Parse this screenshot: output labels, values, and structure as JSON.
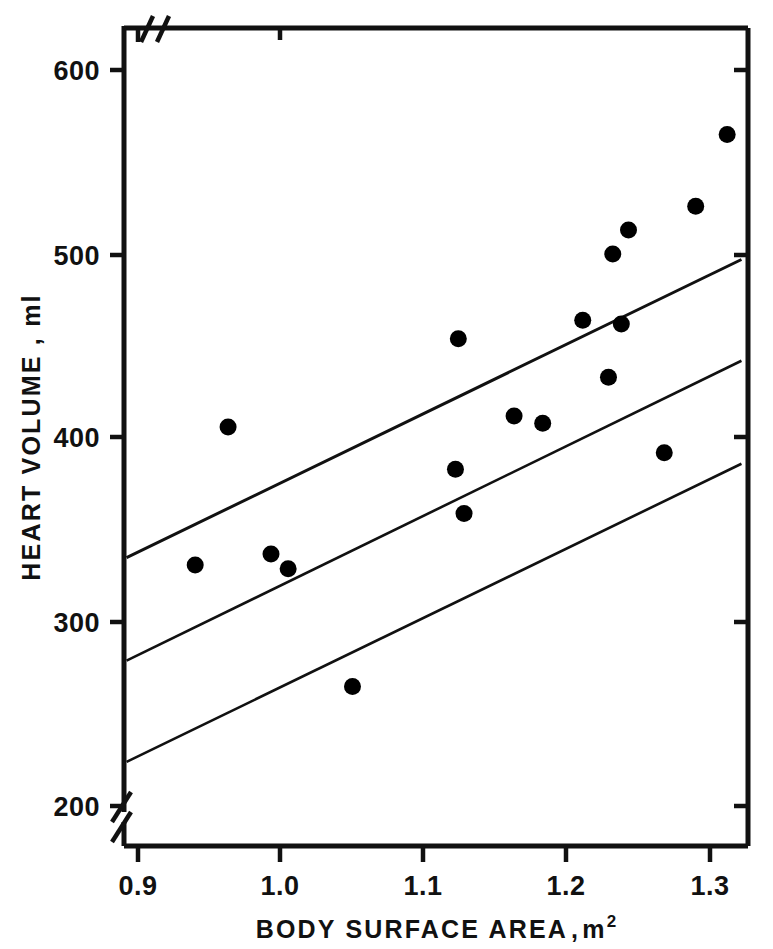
{
  "figure": {
    "name": "heart-volume-vs-body-surface-area-scatter"
  },
  "axes": {
    "x_title_main": "BODY SURFACE AREA",
    "x_title_sep": ",",
    "x_title_unit": "m",
    "x_title_exponent": "2",
    "y_title": "HEART VOLUME , ml",
    "x_ticks": [
      "0.9",
      "1.0",
      "1.1",
      "1.2",
      "1.3"
    ],
    "y_ticks": [
      "600",
      "500",
      "400",
      "300",
      "200"
    ],
    "x_axis_break": true,
    "y_axis_break": true
  },
  "chart_data": {
    "type": "scatter",
    "title": "",
    "xlabel": "BODY SURFACE AREA, m2",
    "ylabel": "HEART VOLUME, ml",
    "xlim": [
      0.88,
      1.325
    ],
    "ylim": [
      196,
      629
    ],
    "xticks": [
      0.9,
      1.0,
      1.1,
      1.2,
      1.3
    ],
    "yticks": [
      200,
      300,
      400,
      500,
      600
    ],
    "grid": false,
    "legend": null,
    "axis_break_x_below": 0.9,
    "axis_break_y_below": 200,
    "marker": "filled-circle",
    "marker_color": "#000000",
    "points": [
      {
        "x": 0.94,
        "y": 331
      },
      {
        "x": 0.963,
        "y": 406
      },
      {
        "x": 0.993,
        "y": 337
      },
      {
        "x": 1.005,
        "y": 329
      },
      {
        "x": 1.05,
        "y": 265
      },
      {
        "x": 1.122,
        "y": 383
      },
      {
        "x": 1.124,
        "y": 454
      },
      {
        "x": 1.128,
        "y": 359
      },
      {
        "x": 1.163,
        "y": 412
      },
      {
        "x": 1.183,
        "y": 408
      },
      {
        "x": 1.211,
        "y": 464
      },
      {
        "x": 1.229,
        "y": 433
      },
      {
        "x": 1.232,
        "y": 500
      },
      {
        "x": 1.238,
        "y": 462
      },
      {
        "x": 1.243,
        "y": 513
      },
      {
        "x": 1.268,
        "y": 392
      },
      {
        "x": 1.29,
        "y": 526
      },
      {
        "x": 1.312,
        "y": 565
      }
    ],
    "series": [
      {
        "name": "upper confidence limit",
        "type": "line",
        "x": [
          0.892,
          1.322
        ],
        "y": [
          335,
          497
        ],
        "linewidth": 3
      },
      {
        "name": "regression line",
        "type": "line",
        "x": [
          0.892,
          1.322
        ],
        "y": [
          279,
          442
        ],
        "linewidth": 2.6
      },
      {
        "name": "lower confidence limit",
        "type": "line",
        "x": [
          0.892,
          1.322
        ],
        "y": [
          224,
          386
        ],
        "linewidth": 2.6
      }
    ]
  }
}
